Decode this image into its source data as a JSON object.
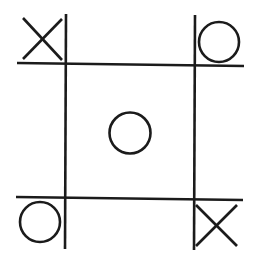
{
  "game": {
    "name": "Tic-tac-toe",
    "board": [
      [
        "X",
        "",
        "O"
      ],
      [
        "",
        "O",
        ""
      ],
      [
        "O",
        "",
        "X"
      ]
    ],
    "colors": {
      "ink": "#1b1b1b",
      "background": "#ffffff"
    },
    "icons": {
      "X": "x-mark-icon",
      "O": "o-mark-icon"
    }
  }
}
